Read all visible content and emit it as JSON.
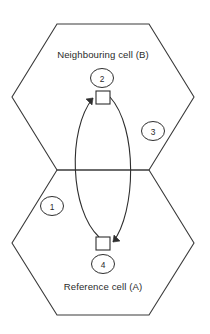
{
  "diagram": {
    "type": "cellular-handover-schematic",
    "background_color": "#ffffff",
    "line_color": "#2e2e2e",
    "text_color": "#2b2b2b",
    "cells": [
      {
        "id": "cell-b",
        "label": "Neighbouring cell (B)",
        "label_x": 103,
        "label_y": 58,
        "position": "top",
        "shape": "hexagon",
        "points": "57,24 149,24 194,97 149,170 57,170 12,97"
      },
      {
        "id": "cell-a",
        "label": "Reference cell (A)",
        "label_x": 103,
        "label_y": 290,
        "position": "bottom",
        "shape": "hexagon",
        "points": "57,170 149,170 194,243 149,315 57,315 12,243"
      }
    ],
    "callouts": [
      {
        "id": "callout-1",
        "label": "1",
        "cx": 52,
        "cy": 206,
        "rx": 11.5,
        "ry": 9.5
      },
      {
        "id": "callout-2",
        "label": "2",
        "cx": 102,
        "cy": 78,
        "rx": 11.5,
        "ry": 9.5
      },
      {
        "id": "callout-3",
        "label": "3",
        "cx": 153,
        "cy": 131,
        "rx": 11.5,
        "ry": 9.5
      },
      {
        "id": "callout-4",
        "label": "4",
        "cx": 103,
        "cy": 264,
        "rx": 11.5,
        "ry": 9.5
      }
    ],
    "markers": [
      {
        "id": "marker-top",
        "x": 96,
        "y": 91,
        "w": 14,
        "h": 13
      },
      {
        "id": "marker-bottom",
        "x": 96,
        "y": 237,
        "w": 14,
        "h": 13
      }
    ],
    "connectors": [
      {
        "id": "connector-left-upward",
        "description": "left arc from bottom marker up to top marker",
        "path": "M 99,237 C 70,210 67,130 93,98",
        "arrow_at": "top",
        "arrow_points": "93,98 86,99 92,105"
      },
      {
        "id": "connector-right-downward",
        "description": "right arc from top marker down to bottom marker",
        "path": "M 110,97 C 138,128 136,212 113,242",
        "arrow_at": "bottom",
        "arrow_points": "113,242 120,241 114,235"
      }
    ]
  }
}
